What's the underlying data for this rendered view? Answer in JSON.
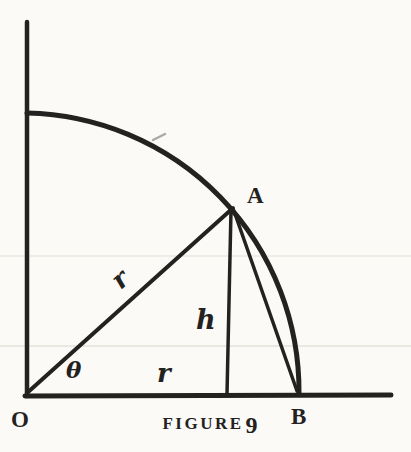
{
  "figure": {
    "caption": {
      "word": "FIGURE",
      "number": "9"
    },
    "points": {
      "origin": "O",
      "apex": "A",
      "base_point": "B"
    },
    "labels": {
      "angle": "θ",
      "radius": "r",
      "height": "h",
      "base": "r"
    },
    "colors": {
      "ink": "#232220",
      "paper": "#fbfaf7",
      "scan_line": "#e3e1d8"
    }
  }
}
